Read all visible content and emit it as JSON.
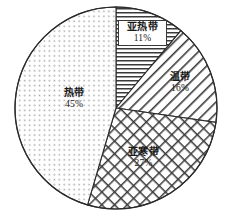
{
  "chart_data": {
    "type": "pie",
    "title": "",
    "subtitle": "",
    "xlabel": "",
    "ylabel": "",
    "legend_position": "none",
    "grid": false,
    "unit": "%",
    "start_angle_deg": 0,
    "direction": "clockwise",
    "categories": [
      "亚热带",
      "温带",
      "亚寒带",
      "热带"
    ],
    "values": [
      11,
      16,
      27,
      45
    ],
    "slices": [
      {
        "id": "subtropical",
        "label": "亚热带",
        "percent_text": "11%",
        "value": 11,
        "pattern": "horizontal-lines",
        "color": "#333333",
        "boxed_label": true
      },
      {
        "id": "temperate",
        "label": "温带",
        "percent_text": "16%",
        "value": 16,
        "pattern": "diagonal-lines-forward",
        "color": "#333333",
        "boxed_label": false
      },
      {
        "id": "subarctic",
        "label": "亚寒带",
        "percent_text": "27%",
        "value": 27,
        "pattern": "crosshatch",
        "color": "#333333",
        "boxed_label": false
      },
      {
        "id": "tropical",
        "label": "热带",
        "percent_text": "45%",
        "value": 45,
        "pattern": "fine-dotted-diagonal",
        "color": "#888888",
        "boxed_label": false
      }
    ]
  },
  "figure": {
    "center_x": 116,
    "center_y": 108,
    "radius": 101,
    "outline_color": "#2b2b2b"
  }
}
